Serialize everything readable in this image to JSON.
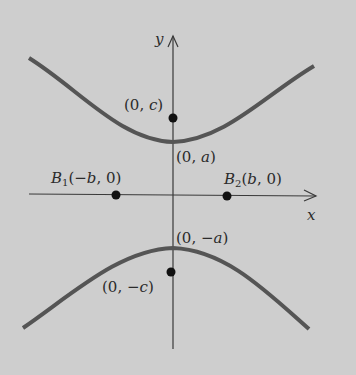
{
  "diagram": {
    "type": "hyperbola-vertical-transverse-axis",
    "colors": {
      "background": "#cecece",
      "curve": "#555555",
      "axis": "#3a3a3a",
      "point": "#111111",
      "text": "#2b2b2b"
    },
    "axes": {
      "x_label": "x",
      "y_label": "y"
    },
    "points": {
      "focus_top": {
        "label": "(0, c)",
        "pre": "(0, ",
        "var": "c",
        "post": ")"
      },
      "vertex_top": {
        "label": "(0, a)",
        "pre": "(0, ",
        "var": "a",
        "post": ")"
      },
      "vertex_bottom": {
        "label": "(0, −a)",
        "pre": "(0, −",
        "var": "a",
        "post": ")"
      },
      "focus_bottom": {
        "label": "(0, −c)",
        "pre": "(0, −",
        "var": "c",
        "post": ")"
      },
      "b1": {
        "label": "B1(−b, 0)",
        "name": "B",
        "sub": "1",
        "pre": "(−",
        "var": "b",
        "post": ", 0)"
      },
      "b2": {
        "label": "B2(b, 0)",
        "name": "B",
        "sub": "2",
        "pre": "(",
        "var": "b",
        "post": ", 0)"
      }
    }
  }
}
